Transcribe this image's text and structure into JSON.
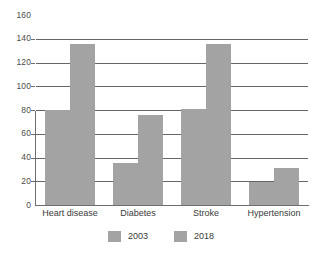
{
  "chart_data": {
    "type": "bar",
    "title": "",
    "subtitle": "",
    "xlabel": "",
    "ylabel": "",
    "ylim": [
      0,
      160
    ],
    "ytick_step": 20,
    "yticks": [
      "0",
      "20",
      "40",
      "60",
      "80",
      "100",
      "120",
      "140",
      "160"
    ],
    "gridlines_at": [
      20,
      40,
      60,
      80,
      100,
      120,
      140
    ],
    "grid": true,
    "legend_position": "bottom-center",
    "categories": [
      "Heart disease",
      "Diabetes",
      "Stroke",
      "Hypertension"
    ],
    "series": [
      {
        "name": "2003",
        "values": [
          80,
          35,
          81,
          19
        ],
        "color": "#a3a3a3"
      },
      {
        "name": "2018",
        "values": [
          136,
          76,
          136,
          31
        ],
        "color": "#a3a3a3"
      }
    ],
    "annotations": []
  },
  "legend": {
    "items": [
      {
        "label": "2003"
      },
      {
        "label": "2018"
      }
    ]
  },
  "colors": {
    "bar": "#a3a3a3",
    "gridline": "#4a4a4a",
    "axis": "#6e6e6e",
    "text": "#3a3a3a",
    "background": "#ffffff"
  }
}
